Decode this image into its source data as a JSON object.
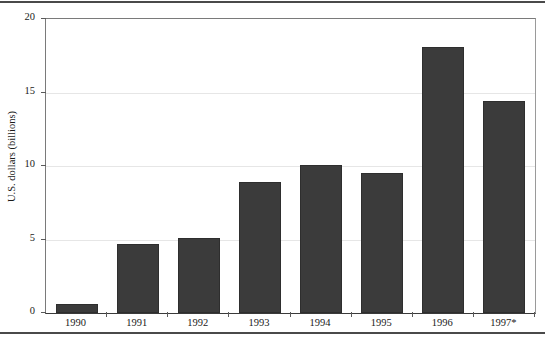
{
  "chart_data": {
    "type": "bar",
    "title": "",
    "subtitle": "",
    "xlabel": "",
    "ylabel": "U.S. dollars (billions)",
    "categories": [
      "1990",
      "1991",
      "1992",
      "1993",
      "1994",
      "1995",
      "1996",
      "1997*"
    ],
    "values": [
      0.6,
      4.7,
      5.1,
      8.9,
      10.1,
      9.5,
      18.1,
      14.4
    ],
    "ylim": [
      0,
      20
    ],
    "yticks": [
      0,
      5,
      10,
      15,
      20
    ],
    "ytick_labels": [
      "0",
      "5",
      "10",
      "15",
      "20"
    ],
    "grid": "horizontal",
    "legend": "none",
    "series": [
      {
        "name": "U.S. dollars (billions)",
        "values": [
          0.6,
          4.7,
          5.1,
          8.9,
          10.1,
          9.5,
          18.1,
          14.4
        ],
        "color": "#3b3b3b"
      }
    ],
    "annotations": [
      "1997 value marked with an asterisk"
    ]
  },
  "colors": {
    "bar": "#3b3b3b",
    "bar_border": "#2e2e2e",
    "gridline": "#e6e6e6",
    "axis": "#3a3a3a",
    "rule": "#4a4a4a",
    "text": "#1a1a1a",
    "background": "#ffffff"
  }
}
